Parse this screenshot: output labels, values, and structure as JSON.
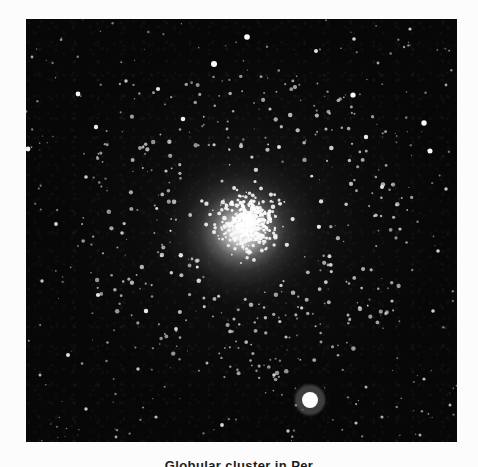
{
  "page": {
    "background_color": "#fcfcfc",
    "margin_color": "#fbfbfb"
  },
  "plate": {
    "label": "globular-cluster-photographic-plate",
    "background_color": "#070707",
    "bounds": {
      "x": 26,
      "y": 19,
      "width": 431,
      "height": 423
    },
    "subject": "Globular cluster",
    "core": {
      "cx": 250,
      "cy": 222,
      "radius": 52,
      "peak_color": "#ffffff"
    }
  },
  "caption": {
    "text": "Globular cluster in Per"
  },
  "stars": {
    "note": "field-star positions in plate-local coordinates, r = radius px, b = brightness 0-1",
    "field": [
      {
        "x": 52,
        "y": 75,
        "r": 2.4,
        "b": 0.95
      },
      {
        "x": 221,
        "y": 18,
        "r": 2.8,
        "b": 1.0
      },
      {
        "x": 188,
        "y": 45,
        "r": 3.0,
        "b": 1.0
      },
      {
        "x": 290,
        "y": 32,
        "r": 2.0,
        "b": 0.85
      },
      {
        "x": 328,
        "y": 20,
        "r": 1.8,
        "b": 0.8
      },
      {
        "x": 384,
        "y": 10,
        "r": 1.6,
        "b": 0.7
      },
      {
        "x": 100,
        "y": 62,
        "r": 1.7,
        "b": 0.72
      },
      {
        "x": 132,
        "y": 70,
        "r": 2.1,
        "b": 0.88
      },
      {
        "x": 70,
        "y": 108,
        "r": 2.2,
        "b": 0.9
      },
      {
        "x": 157,
        "y": 100,
        "r": 2.3,
        "b": 0.92
      },
      {
        "x": 244,
        "y": 90,
        "r": 1.6,
        "b": 0.65
      },
      {
        "x": 327,
        "y": 76,
        "r": 2.6,
        "b": 0.98
      },
      {
        "x": 2,
        "y": 130,
        "r": 2.4,
        "b": 0.93
      },
      {
        "x": 117,
        "y": 128,
        "r": 1.5,
        "b": 0.62
      },
      {
        "x": 201,
        "y": 110,
        "r": 1.4,
        "b": 0.58
      },
      {
        "x": 253,
        "y": 128,
        "r": 2.0,
        "b": 0.84
      },
      {
        "x": 300,
        "y": 110,
        "r": 1.5,
        "b": 0.6
      },
      {
        "x": 340,
        "y": 118,
        "r": 2.2,
        "b": 0.9
      },
      {
        "x": 398,
        "y": 104,
        "r": 2.7,
        "b": 1.0
      },
      {
        "x": 404,
        "y": 132,
        "r": 2.5,
        "b": 0.96
      },
      {
        "x": 60,
        "y": 158,
        "r": 1.8,
        "b": 0.76
      },
      {
        "x": 140,
        "y": 152,
        "r": 1.6,
        "b": 0.68
      },
      {
        "x": 196,
        "y": 162,
        "r": 1.5,
        "b": 0.62
      },
      {
        "x": 356,
        "y": 168,
        "r": 2.0,
        "b": 0.84
      },
      {
        "x": 420,
        "y": 170,
        "r": 1.7,
        "b": 0.72
      },
      {
        "x": 30,
        "y": 205,
        "r": 1.9,
        "b": 0.8
      },
      {
        "x": 96,
        "y": 214,
        "r": 1.7,
        "b": 0.72
      },
      {
        "x": 374,
        "y": 210,
        "r": 1.6,
        "b": 0.66
      },
      {
        "x": 412,
        "y": 232,
        "r": 1.8,
        "b": 0.75
      },
      {
        "x": 16,
        "y": 262,
        "r": 1.7,
        "b": 0.7
      },
      {
        "x": 72,
        "y": 276,
        "r": 2.1,
        "b": 0.88
      },
      {
        "x": 120,
        "y": 292,
        "r": 2.2,
        "b": 0.9
      },
      {
        "x": 150,
        "y": 310,
        "r": 1.9,
        "b": 0.8
      },
      {
        "x": 208,
        "y": 300,
        "r": 1.5,
        "b": 0.62
      },
      {
        "x": 260,
        "y": 318,
        "r": 1.6,
        "b": 0.66
      },
      {
        "x": 322,
        "y": 296,
        "r": 1.5,
        "b": 0.6
      },
      {
        "x": 366,
        "y": 282,
        "r": 1.6,
        "b": 0.66
      },
      {
        "x": 407,
        "y": 292,
        "r": 1.8,
        "b": 0.76
      },
      {
        "x": 42,
        "y": 336,
        "r": 2.0,
        "b": 0.84
      },
      {
        "x": 112,
        "y": 350,
        "r": 1.7,
        "b": 0.7
      },
      {
        "x": 181,
        "y": 344,
        "r": 1.5,
        "b": 0.6
      },
      {
        "x": 248,
        "y": 356,
        "r": 1.8,
        "b": 0.76
      },
      {
        "x": 284,
        "y": 381,
        "r": 8.0,
        "b": 1.0
      },
      {
        "x": 340,
        "y": 368,
        "r": 1.5,
        "b": 0.6
      },
      {
        "x": 398,
        "y": 360,
        "r": 1.6,
        "b": 0.66
      },
      {
        "x": 60,
        "y": 390,
        "r": 1.7,
        "b": 0.72
      },
      {
        "x": 130,
        "y": 398,
        "r": 1.6,
        "b": 0.66
      },
      {
        "x": 196,
        "y": 406,
        "r": 1.9,
        "b": 0.8
      },
      {
        "x": 262,
        "y": 412,
        "r": 1.7,
        "b": 0.7
      },
      {
        "x": 330,
        "y": 404,
        "r": 1.6,
        "b": 0.66
      },
      {
        "x": 356,
        "y": 398,
        "r": 1.5,
        "b": 0.6
      },
      {
        "x": 394,
        "y": 416,
        "r": 1.5,
        "b": 0.58
      },
      {
        "x": 424,
        "y": 386,
        "r": 1.5,
        "b": 0.6
      },
      {
        "x": 90,
        "y": 418,
        "r": 1.4,
        "b": 0.55
      },
      {
        "x": 14,
        "y": 356,
        "r": 1.5,
        "b": 0.6
      },
      {
        "x": 166,
        "y": 240,
        "r": 1.4,
        "b": 0.55
      },
      {
        "x": 302,
        "y": 246,
        "r": 1.4,
        "b": 0.55
      },
      {
        "x": 352,
        "y": 44,
        "r": 1.4,
        "b": 0.55
      },
      {
        "x": 420,
        "y": 66,
        "r": 1.4,
        "b": 0.52
      },
      {
        "x": 6,
        "y": 38,
        "r": 1.4,
        "b": 0.55
      }
    ],
    "core_seed": 20251,
    "core_count": 520,
    "halo_count": 260
  }
}
